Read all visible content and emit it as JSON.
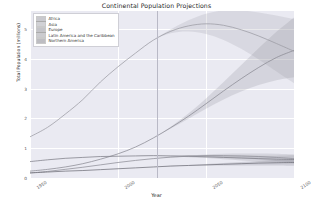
{
  "chart_data": {
    "type": "line",
    "title": "Continental Population Projections",
    "xlabel": "Year",
    "ylabel": "Total Population (millions)",
    "xlim": [
      1950,
      2100
    ],
    "ylim": [
      0,
      5.6
    ],
    "grid": true,
    "legend_position": "upper left",
    "xticks": [
      1950,
      2000,
      2050,
      2100
    ],
    "xticklabels": [
      "1950",
      "2000",
      "2050",
      "2100"
    ],
    "yticks": [
      0,
      1,
      2,
      3,
      4,
      5
    ],
    "yticklabels": [
      "0",
      "1",
      "2",
      "3",
      "4",
      "5"
    ],
    "annotations": [
      {
        "type": "vline",
        "x": 2022,
        "label": "projection start"
      }
    ],
    "x": [
      1950,
      1960,
      1970,
      1980,
      1990,
      2000,
      2010,
      2020,
      2030,
      2040,
      2050,
      2060,
      2070,
      2080,
      2090,
      2100
    ],
    "series": [
      {
        "name": "Africa",
        "color": "#8a8a93",
        "values": [
          0.23,
          0.29,
          0.37,
          0.48,
          0.63,
          0.81,
          1.04,
          1.34,
          1.69,
          2.07,
          2.49,
          2.92,
          3.33,
          3.71,
          4.04,
          4.28
        ],
        "band_low": [
          0.23,
          0.29,
          0.37,
          0.48,
          0.63,
          0.81,
          1.04,
          1.34,
          1.66,
          1.99,
          2.32,
          2.63,
          2.9,
          3.12,
          3.28,
          3.38
        ],
        "band_high": [
          0.23,
          0.29,
          0.37,
          0.48,
          0.63,
          0.81,
          1.04,
          1.34,
          1.72,
          2.16,
          2.67,
          3.22,
          3.79,
          4.36,
          4.9,
          5.38
        ]
      },
      {
        "name": "Asia",
        "color": "#9b9ba4",
        "values": [
          1.38,
          1.7,
          2.14,
          2.63,
          3.22,
          3.73,
          4.19,
          4.62,
          4.92,
          5.1,
          5.17,
          5.12,
          4.97,
          4.76,
          4.51,
          4.25
        ],
        "band_low": [
          1.38,
          1.7,
          2.14,
          2.63,
          3.22,
          3.73,
          4.19,
          4.62,
          4.85,
          4.91,
          4.83,
          4.63,
          4.33,
          3.97,
          3.57,
          3.18
        ],
        "band_high": [
          1.38,
          1.7,
          2.14,
          2.63,
          3.22,
          3.73,
          4.19,
          4.62,
          4.99,
          5.29,
          5.51,
          5.62,
          5.62,
          5.55,
          5.45,
          5.33
        ]
      },
      {
        "name": "Europe",
        "color": "#7e7e88",
        "values": [
          0.55,
          0.61,
          0.66,
          0.69,
          0.72,
          0.73,
          0.74,
          0.75,
          0.74,
          0.73,
          0.71,
          0.69,
          0.67,
          0.65,
          0.63,
          0.62
        ],
        "band_low": [
          0.55,
          0.61,
          0.66,
          0.69,
          0.72,
          0.73,
          0.74,
          0.75,
          0.73,
          0.7,
          0.67,
          0.63,
          0.59,
          0.55,
          0.51,
          0.48
        ],
        "band_high": [
          0.55,
          0.61,
          0.66,
          0.69,
          0.72,
          0.73,
          0.74,
          0.75,
          0.75,
          0.76,
          0.76,
          0.75,
          0.75,
          0.75,
          0.75,
          0.76
        ]
      },
      {
        "name": "Latin America and the Caribbean",
        "color": "#8e8e97",
        "values": [
          0.17,
          0.22,
          0.29,
          0.36,
          0.44,
          0.52,
          0.59,
          0.65,
          0.7,
          0.73,
          0.75,
          0.75,
          0.74,
          0.72,
          0.69,
          0.65
        ],
        "band_low": [
          0.17,
          0.22,
          0.29,
          0.36,
          0.44,
          0.52,
          0.59,
          0.65,
          0.69,
          0.71,
          0.71,
          0.69,
          0.66,
          0.62,
          0.57,
          0.52
        ],
        "band_high": [
          0.17,
          0.22,
          0.29,
          0.36,
          0.44,
          0.52,
          0.59,
          0.65,
          0.71,
          0.76,
          0.79,
          0.81,
          0.82,
          0.82,
          0.81,
          0.79
        ]
      },
      {
        "name": "Northern America",
        "color": "#6f6f79",
        "values": [
          0.17,
          0.2,
          0.23,
          0.25,
          0.28,
          0.31,
          0.34,
          0.37,
          0.4,
          0.42,
          0.44,
          0.46,
          0.48,
          0.5,
          0.51,
          0.52
        ],
        "band_low": [
          0.17,
          0.2,
          0.23,
          0.25,
          0.28,
          0.31,
          0.34,
          0.37,
          0.39,
          0.41,
          0.42,
          0.42,
          0.42,
          0.42,
          0.42,
          0.41
        ],
        "band_high": [
          0.17,
          0.2,
          0.23,
          0.25,
          0.28,
          0.31,
          0.34,
          0.37,
          0.41,
          0.44,
          0.47,
          0.5,
          0.54,
          0.57,
          0.6,
          0.63
        ]
      }
    ]
  },
  "legend": {
    "items": [
      {
        "label": "Africa"
      },
      {
        "label": "Asia"
      },
      {
        "label": "Europe"
      },
      {
        "label": "Latin America and the Caribbean"
      },
      {
        "label": "Northern America"
      }
    ]
  }
}
